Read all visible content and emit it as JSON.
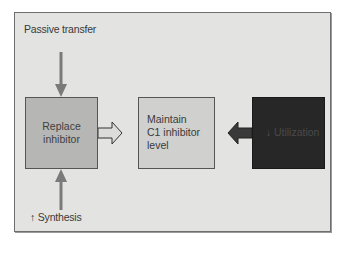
{
  "diagram": {
    "inputs": {
      "top_label": "Passive transfer",
      "bottom_label": "Synthesis",
      "bottom_label_prefix_icon": "up-arrow-icon"
    },
    "boxes": [
      {
        "id": "replace",
        "lines": [
          "Replace",
          "inhibitor"
        ],
        "fill": "#b6b6b4"
      },
      {
        "id": "maintain",
        "lines": [
          "Maintain",
          "C1 inhibitor",
          "level"
        ],
        "fill": "#d0d0ce"
      },
      {
        "id": "utilization",
        "label": "Utilization",
        "prefix_icon": "down-arrow-icon",
        "fill": "#272727"
      }
    ],
    "arrows": [
      {
        "from": "Passive transfer",
        "to": "replace",
        "direction": "down",
        "style": "thin-gray"
      },
      {
        "from": "Synthesis",
        "to": "replace",
        "direction": "up",
        "style": "thin-gray"
      },
      {
        "from": "replace",
        "to": "maintain",
        "direction": "right",
        "style": "outline-block"
      },
      {
        "from": "utilization",
        "to": "maintain",
        "direction": "left",
        "style": "dark-block"
      }
    ],
    "colors": {
      "frame_bg": "#e3e3e1",
      "arrow_gray": "#7a7a7a",
      "dark_arrow": "#3a3a3a"
    }
  }
}
